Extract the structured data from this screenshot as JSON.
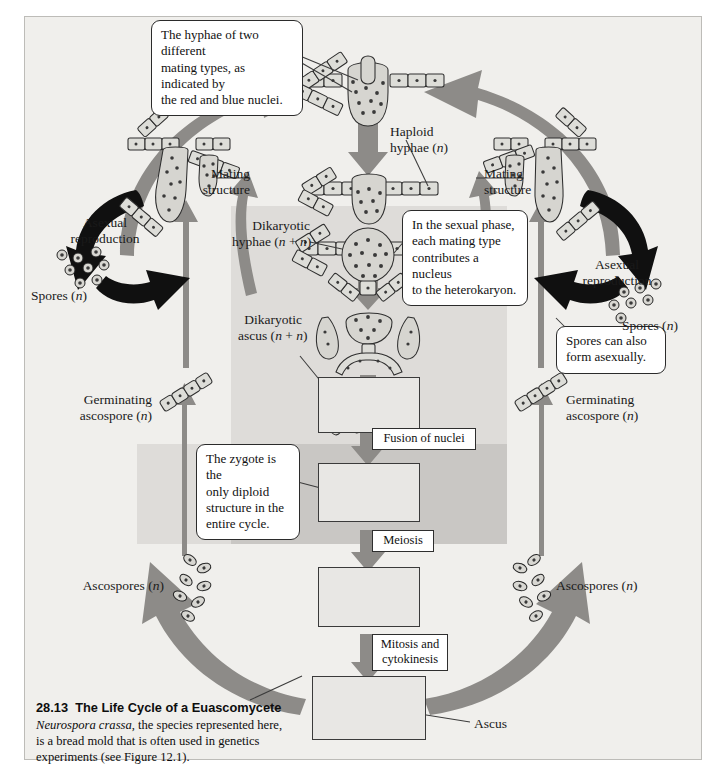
{
  "figure": {
    "number": "28.13",
    "title": "The Life Cycle of a Euascomycete",
    "caption_line1": "Neurospora crassa",
    "caption_line2": ", the species represented here,",
    "caption_line3": "is a bread mold that is often used in genetics",
    "caption_line4": "experiments (see Figure 12.1)."
  },
  "callouts": {
    "mating_types": "The hyphae of two different\nmating types, as indicated by\nthe red and blue nuclei.",
    "sexual_phase": "In the sexual phase,\neach mating type\ncontributes a nucleus\nto the heterokaryon.",
    "zygote": "The zygote is the\nonly diploid\nstructure in the\nentire cycle.",
    "spores_asexual": "Spores can also\nform asexually."
  },
  "labels": {
    "haploid_hyphae": "Haploid\nhyphae (n)",
    "mating_structure_left": "Mating\nstructure",
    "mating_structure_right": "Mating\nstructure",
    "dikaryotic_hyphae": "Dikaryotic\nhyphae (n + n)",
    "dikaryotic_ascus": "Dikaryotic\nascus (n + n)",
    "asexual_reproduction_left": "Asexual\nreproduction",
    "asexual_reproduction_right": "Asexual\nreproduction",
    "spores_left": "Spores (n)",
    "spores_right": "Spores (n)",
    "germinating_ascospore_left": "Germinating\nascospore (n)",
    "germinating_ascospore_right": "Germinating\nascospore (n)",
    "ascospores_left": "Ascospores (n)",
    "ascospores_right": "Ascospores (n)",
    "ascus": "Ascus"
  },
  "process_labels": {
    "fusion": "Fusion of nuclei",
    "meiosis": "Meiosis",
    "mitosis": "Mitosis and\ncytokinesis"
  },
  "colors": {
    "page_background": "#ffffff",
    "panel_background": "#f0efec",
    "shade_light": "#dedcd9",
    "shade_dark": "#c9c7c4",
    "gray_arrow": "#8d8b88",
    "black_arrow": "#101010",
    "cell_fill": "#ddddd8",
    "outline": "#2e2e2e"
  },
  "stages": {
    "dikaryotic_ascus_nuclei_per_cell": 2,
    "zygote_nuclei_per_cell": 1,
    "meiosis_nuclei_per_cell": 4,
    "ascus_cells": 4
  }
}
